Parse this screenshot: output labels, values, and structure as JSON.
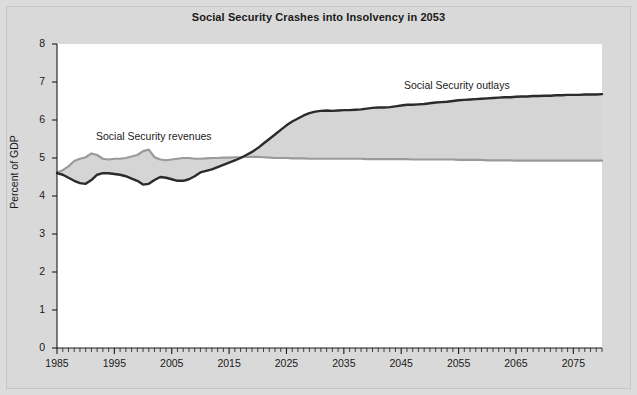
{
  "figure": {
    "title": "Social Security Crashes into Insolvency in 2053",
    "background_color": "#d9d9d9",
    "plot_background_color": "#ffffff"
  },
  "annotations": {
    "revenues_label": "Social Security revenues",
    "outlays_label": "Social Security outlays"
  },
  "chart_data": {
    "type": "area",
    "title": "Social Security Crashes into Insolvency in 2053",
    "xlabel": "",
    "ylabel": "Percent of GDP",
    "xlim": [
      1985,
      2080
    ],
    "ylim": [
      0,
      8
    ],
    "yticks": [
      0,
      1,
      2,
      3,
      4,
      5,
      6,
      7,
      8
    ],
    "xticks": [
      1985,
      1995,
      2005,
      2015,
      2025,
      2035,
      2045,
      2055,
      2065,
      2075
    ],
    "xtick_minor_interval": 1,
    "grid": false,
    "legend": "inline-annotations",
    "fill_between_color": "#d5d5d5",
    "series": [
      {
        "name": "Social Security revenues",
        "color": "#9a9a9a",
        "line_width": 2.2,
        "x": [
          1985,
          1986,
          1987,
          1988,
          1989,
          1990,
          1991,
          1992,
          1993,
          1994,
          1995,
          1996,
          1997,
          1998,
          1999,
          2000,
          2001,
          2002,
          2003,
          2004,
          2005,
          2006,
          2007,
          2008,
          2009,
          2010,
          2011,
          2012,
          2013,
          2014,
          2015,
          2016,
          2017,
          2018,
          2019,
          2020,
          2021,
          2022,
          2023,
          2024,
          2025,
          2026,
          2027,
          2028,
          2029,
          2030,
          2031,
          2032,
          2033,
          2034,
          2035,
          2036,
          2037,
          2038,
          2039,
          2040,
          2041,
          2042,
          2043,
          2044,
          2045,
          2046,
          2047,
          2048,
          2049,
          2050,
          2051,
          2052,
          2053,
          2054,
          2055,
          2056,
          2057,
          2058,
          2059,
          2060,
          2061,
          2062,
          2063,
          2064,
          2065,
          2066,
          2067,
          2068,
          2069,
          2070,
          2071,
          2072,
          2073,
          2074,
          2075,
          2076,
          2077,
          2078,
          2079,
          2080
        ],
        "values": [
          4.62,
          4.68,
          4.78,
          4.92,
          4.98,
          5.02,
          5.12,
          5.08,
          4.98,
          4.96,
          4.98,
          4.98,
          5.0,
          5.04,
          5.08,
          5.18,
          5.22,
          5.02,
          4.96,
          4.94,
          4.96,
          4.98,
          5.0,
          5.0,
          4.98,
          4.98,
          4.99,
          5.0,
          5.0,
          5.01,
          5.01,
          5.02,
          5.02,
          5.03,
          5.03,
          5.03,
          5.02,
          5.01,
          5.0,
          5.0,
          5.0,
          4.99,
          4.99,
          4.99,
          4.98,
          4.98,
          4.98,
          4.98,
          4.98,
          4.98,
          4.98,
          4.98,
          4.98,
          4.98,
          4.97,
          4.97,
          4.97,
          4.97,
          4.97,
          4.97,
          4.97,
          4.97,
          4.96,
          4.96,
          4.96,
          4.96,
          4.96,
          4.96,
          4.96,
          4.96,
          4.95,
          4.95,
          4.95,
          4.95,
          4.95,
          4.94,
          4.94,
          4.94,
          4.94,
          4.94,
          4.93,
          4.93,
          4.93,
          4.93,
          4.93,
          4.93,
          4.93,
          4.93,
          4.93,
          4.93,
          4.93,
          4.93,
          4.93,
          4.93,
          4.93,
          4.93
        ]
      },
      {
        "name": "Social Security outlays",
        "color": "#2b2b2b",
        "line_width": 2.4,
        "x": [
          1985,
          1986,
          1987,
          1988,
          1989,
          1990,
          1991,
          1992,
          1993,
          1994,
          1995,
          1996,
          1997,
          1998,
          1999,
          2000,
          2001,
          2002,
          2003,
          2004,
          2005,
          2006,
          2007,
          2008,
          2009,
          2010,
          2011,
          2012,
          2013,
          2014,
          2015,
          2016,
          2017,
          2018,
          2019,
          2020,
          2021,
          2022,
          2023,
          2024,
          2025,
          2026,
          2027,
          2028,
          2029,
          2030,
          2031,
          2032,
          2033,
          2034,
          2035,
          2036,
          2037,
          2038,
          2039,
          2040,
          2041,
          2042,
          2043,
          2044,
          2045,
          2046,
          2047,
          2048,
          2049,
          2050,
          2051,
          2052,
          2053,
          2054,
          2055,
          2056,
          2057,
          2058,
          2059,
          2060,
          2061,
          2062,
          2063,
          2064,
          2065,
          2066,
          2067,
          2068,
          2069,
          2070,
          2071,
          2072,
          2073,
          2074,
          2075,
          2076,
          2077,
          2078,
          2079,
          2080
        ],
        "values": [
          4.6,
          4.56,
          4.48,
          4.4,
          4.34,
          4.32,
          4.42,
          4.56,
          4.6,
          4.6,
          4.58,
          4.56,
          4.52,
          4.46,
          4.4,
          4.3,
          4.32,
          4.42,
          4.5,
          4.48,
          4.44,
          4.4,
          4.4,
          4.44,
          4.52,
          4.62,
          4.66,
          4.7,
          4.76,
          4.82,
          4.88,
          4.94,
          5.0,
          5.08,
          5.16,
          5.26,
          5.38,
          5.5,
          5.62,
          5.74,
          5.86,
          5.96,
          6.04,
          6.12,
          6.18,
          6.22,
          6.24,
          6.25,
          6.24,
          6.25,
          6.26,
          6.26,
          6.27,
          6.28,
          6.3,
          6.32,
          6.33,
          6.33,
          6.34,
          6.36,
          6.38,
          6.4,
          6.4,
          6.41,
          6.42,
          6.44,
          6.46,
          6.47,
          6.48,
          6.5,
          6.52,
          6.53,
          6.54,
          6.55,
          6.56,
          6.57,
          6.58,
          6.59,
          6.6,
          6.6,
          6.61,
          6.62,
          6.62,
          6.63,
          6.63,
          6.64,
          6.64,
          6.65,
          6.65,
          6.66,
          6.66,
          6.66,
          6.67,
          6.67,
          6.67,
          6.68
        ]
      }
    ]
  }
}
